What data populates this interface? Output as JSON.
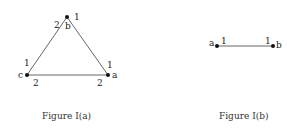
{
  "figure_a": {
    "caption": "Figure I(a)",
    "vertices": [
      {
        "name": "a",
        "x": 108,
        "y": 75
      },
      {
        "name": "b",
        "x": 67,
        "y": 17
      },
      {
        "name": "c",
        "x": 27,
        "y": 75
      }
    ],
    "edge_labels": {
      "b_top": "1",
      "b_left": "2",
      "c_up": "1",
      "c_right": "2",
      "a_up": "1",
      "a_left": "2"
    }
  },
  "figure_b": {
    "caption": "Figure I(b)",
    "vertices": [
      {
        "name": "a",
        "x": 217,
        "y": 46
      },
      {
        "name": "b",
        "x": 273,
        "y": 46
      }
    ],
    "edge_labels": {
      "a_right": "1",
      "b_left": "1"
    }
  },
  "colors": {
    "ink": "#222222",
    "line": "#555555",
    "background": "#ffffff"
  }
}
